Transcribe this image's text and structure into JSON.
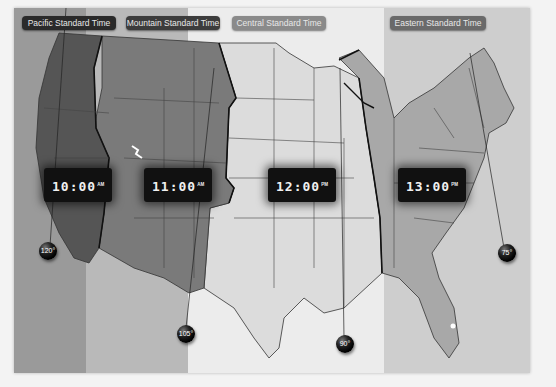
{
  "zones": [
    {
      "id": "pacific",
      "label": "Pacific Standard Time",
      "time": "10:00",
      "ampm": "AM",
      "meridian": "120°",
      "band_color": "#9a9a9a",
      "label_bg": "#2a2a2a",
      "land_color": "#5a5a5a"
    },
    {
      "id": "mountain",
      "label": "Mountain Standard Time",
      "time": "11:00",
      "ampm": "AM",
      "meridian": "105°",
      "band_color": "#bdbdbd",
      "label_bg": "#3c3c3c",
      "land_color": "#7a7a7a"
    },
    {
      "id": "central",
      "label": "Central Standard Time",
      "time": "12:00",
      "ampm": "PM",
      "meridian": "90°",
      "band_color": "#ececec",
      "label_bg": "#8a8a8a",
      "land_color": "#d8d8d8"
    },
    {
      "id": "eastern",
      "label": "Eastern Standard Time",
      "time": "13:00",
      "ampm": "PM",
      "meridian": "75°",
      "band_color": "#cfcfcf",
      "label_bg": "#6a6a6a",
      "land_color": "#a5a5a5"
    }
  ],
  "colors": {
    "border": "#222222",
    "state_line": "#333333",
    "background": "#f3f3f3"
  }
}
